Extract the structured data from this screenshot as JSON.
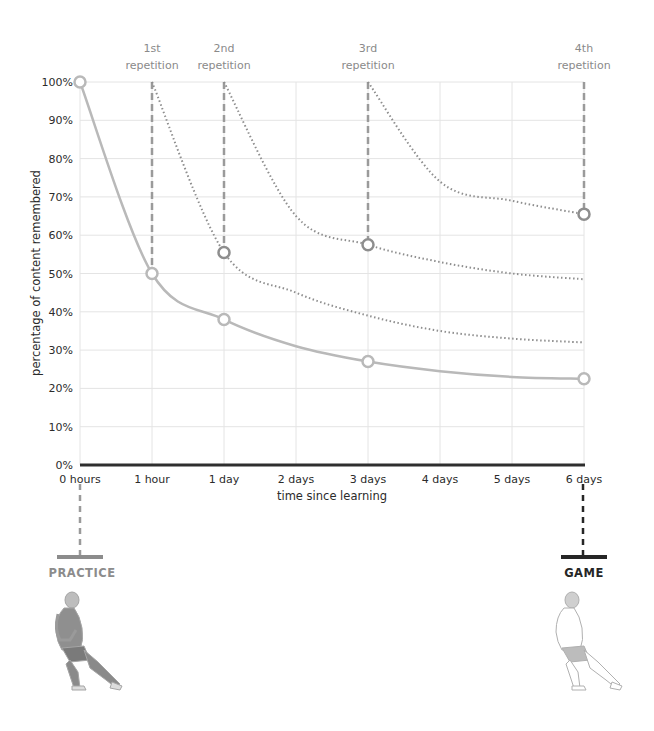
{
  "chart_data": {
    "type": "line",
    "title": "",
    "xlabel": "time since learning",
    "ylabel": "percentage of content remembered",
    "x_categories": [
      "0 hours",
      "1 hour",
      "1 day",
      "2 days",
      "3 days",
      "4 days",
      "5 days",
      "6 days"
    ],
    "y_ticks": [
      "0%",
      "10%",
      "20%",
      "30%",
      "40%",
      "50%",
      "60%",
      "70%",
      "80%",
      "90%",
      "100%"
    ],
    "ylim": [
      0,
      100
    ],
    "grid": true,
    "series": [
      {
        "name": "forgetting curve (no repetition)",
        "style": "solid",
        "x": [
          0,
          1,
          2,
          3,
          4,
          5,
          6,
          7
        ],
        "values": [
          100,
          50,
          38,
          31,
          27,
          24.5,
          23,
          22.5
        ],
        "markers": [
          {
            "x": 0,
            "y": 100
          },
          {
            "x": 1,
            "y": 50
          },
          {
            "x": 2,
            "y": 38
          },
          {
            "x": 4,
            "y": 27
          },
          {
            "x": 7,
            "y": 22.5
          }
        ]
      },
      {
        "name": "after 1st repetition",
        "style": "dotted",
        "x": [
          1,
          2,
          3,
          4,
          5,
          6,
          7
        ],
        "values": [
          100,
          55.5,
          45,
          39,
          35,
          33,
          32
        ],
        "markers": [
          {
            "x": 2,
            "y": 55.5
          }
        ]
      },
      {
        "name": "after 2nd repetition",
        "style": "dotted",
        "x": [
          2,
          3,
          4,
          5,
          6,
          7
        ],
        "values": [
          100,
          65,
          57.5,
          53,
          50,
          48.5
        ],
        "markers": [
          {
            "x": 4,
            "y": 57.5
          }
        ]
      },
      {
        "name": "after 3rd repetition",
        "style": "dotted",
        "x": [
          4,
          5,
          6,
          7
        ],
        "values": [
          100,
          74,
          69,
          65.5
        ],
        "markers": [
          {
            "x": 7,
            "y": 65.5
          }
        ]
      }
    ],
    "annotations": [
      {
        "text": "1st repetition",
        "x": 1
      },
      {
        "text": "2nd repetition",
        "x": 2
      },
      {
        "text": "3rd repetition",
        "x": 4
      },
      {
        "text": "4th repetition",
        "x": 7
      },
      {
        "text": "PRACTICE",
        "x": 0
      },
      {
        "text": "GAME",
        "x": 7
      }
    ]
  },
  "labels": {
    "reps": [
      {
        "line1": "1st",
        "line2": "repetition"
      },
      {
        "line1": "2nd",
        "line2": "repetition"
      },
      {
        "line1": "3rd",
        "line2": "repetition"
      },
      {
        "line1": "4th",
        "line2": "repetition"
      }
    ],
    "practice": "PRACTICE",
    "game": "GAME"
  },
  "colors": {
    "curve": "#b9b9b9",
    "dotted": "#8e8e8e",
    "dashed": "#9a9a9a",
    "grid": "#e4e4e4",
    "axis": "#2e2e2e",
    "practice": "#8c8c8c",
    "game": "#262626"
  }
}
